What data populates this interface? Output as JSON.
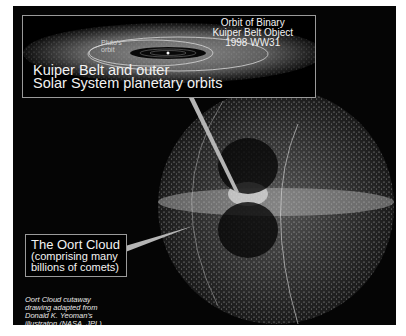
{
  "diagram": {
    "inset": {
      "title_line1": "Kuiper Belt and outer",
      "title_line2": "Solar System planetary orbits",
      "orbit_label_line1": "Orbit of Binary",
      "orbit_label_line2": "Kuiper Belt Object",
      "orbit_label_line3": "1998 WW31",
      "pluto_label_line1": "Pluto's",
      "pluto_label_line2": "orbit"
    },
    "oort": {
      "title": "The Oort Cloud",
      "subtitle_line1": "(comprising many",
      "subtitle_line2": "billions of comets)"
    },
    "credit": {
      "line1": "Oort Cloud cutaway",
      "line2": "drawing adapted from",
      "line3": "Donald K. Yeoman's",
      "line4": "illustraton (NASA, JPL)"
    },
    "colors": {
      "background": "#050505",
      "text": "#f2f2f2",
      "border": "#9a9a9a",
      "pointer": "#b5b5b5"
    }
  }
}
